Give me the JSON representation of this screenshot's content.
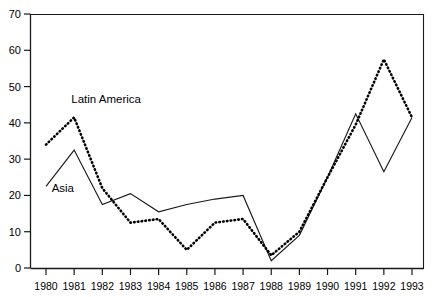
{
  "chart_data": {
    "type": "line",
    "title": "",
    "subtitle": "",
    "xlabel": "",
    "ylabel": "",
    "categories": [
      "1980",
      "1981",
      "1982",
      "1983",
      "1984",
      "1985",
      "1986",
      "1987",
      "1988",
      "1989",
      "1990",
      "1991",
      "1992",
      "1993"
    ],
    "x": [
      1980,
      1981,
      1982,
      1983,
      1984,
      1985,
      1986,
      1987,
      1988,
      1989,
      1990,
      1991,
      1992,
      1993
    ],
    "xlim": [
      1980,
      1993
    ],
    "ylim": [
      0,
      70
    ],
    "yticks": [
      0,
      10,
      20,
      30,
      40,
      50,
      60,
      70
    ],
    "ytick_labels": [
      "0",
      "10",
      "20",
      "30",
      "40",
      "50",
      "60",
      "70"
    ],
    "grid": false,
    "legend_position": "inline-annotations",
    "series": [
      {
        "name": "Asia",
        "style": "solid",
        "color": "#1a1a1a",
        "values": [
          22.5,
          32.5,
          17.5,
          20.5,
          15.5,
          17.5,
          19.0,
          20.0,
          2.0,
          9.0,
          25.0,
          42.5,
          26.5,
          41.5
        ]
      },
      {
        "name": "Latin America",
        "style": "dotted",
        "color": "#000000",
        "values": [
          34.0,
          41.5,
          22.0,
          12.5,
          13.5,
          5.0,
          12.5,
          13.5,
          3.5,
          10.0,
          25.0,
          39.5,
          57.5,
          41.5
        ]
      }
    ],
    "annotations": [
      {
        "text": "Latin America",
        "x": 1980.9,
        "y": 45.5
      },
      {
        "text": "Asia",
        "x": 1980.2,
        "y": 21.0
      }
    ]
  }
}
